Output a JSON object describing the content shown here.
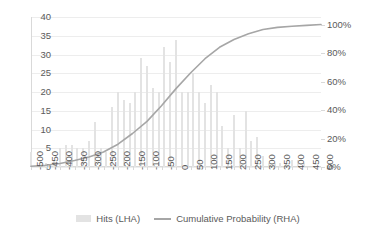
{
  "chart_data": {
    "type": "bar",
    "title": "",
    "subtitle": "",
    "xlabel": "",
    "ylabel": "",
    "y2label": "",
    "grid": true,
    "legend_position": "bottom",
    "xlim": [
      -500,
      500
    ],
    "ylim": [
      0,
      40
    ],
    "y2lim": [
      0,
      100
    ],
    "ytick_labels": [
      "40",
      "35",
      "30",
      "25",
      "20",
      "15",
      "10",
      "5",
      "0"
    ],
    "ytick_values": [
      40,
      35,
      30,
      25,
      20,
      15,
      10,
      5,
      0
    ],
    "y2tick_labels": [
      "100%",
      "80%",
      "60%",
      "40%",
      "20%",
      "0%"
    ],
    "y2tick_values": [
      100,
      80,
      60,
      40,
      20,
      0
    ],
    "xtick_labels": [
      "-500",
      "-450",
      "-400",
      "-350",
      "-300",
      "-250",
      "-200",
      "-150",
      "-100",
      "-50",
      "0",
      "50",
      "100",
      "150",
      "200",
      "250",
      "300",
      "350",
      "400",
      "450",
      "500"
    ],
    "xtick_values": [
      -500,
      -450,
      -400,
      -350,
      -300,
      -250,
      -200,
      -150,
      -100,
      -50,
      0,
      50,
      100,
      150,
      200,
      250,
      300,
      350,
      400,
      450,
      500
    ],
    "legend": [
      "Hits (LHA)",
      "Cumulative Probability (RHA)"
    ],
    "series": [
      {
        "name": "Hits (LHA)",
        "axis": "left",
        "type": "bar",
        "color": "#e3e3e3",
        "x": [
          -500,
          -490,
          -480,
          -470,
          -460,
          -450,
          -440,
          -430,
          -420,
          -410,
          -400,
          -390,
          -380,
          -370,
          -360,
          -350,
          -340,
          -330,
          -320,
          -310,
          -300,
          -290,
          -280,
          -270,
          -260,
          -250,
          -240,
          -230,
          -220,
          -210,
          -200,
          -190,
          -180,
          -170,
          -160,
          -150,
          -140,
          -130,
          -120,
          -110,
          -100,
          -90,
          -80,
          -70,
          -60,
          -50,
          -40,
          -30,
          -20,
          -10,
          0,
          10,
          20,
          30,
          40,
          50,
          60,
          70,
          80,
          90,
          100,
          110,
          120,
          130,
          140,
          150,
          160,
          170,
          180,
          190,
          200,
          210,
          220,
          230,
          240,
          250,
          260,
          270,
          280,
          290,
          300,
          310,
          320,
          330,
          340,
          350,
          360,
          370,
          380,
          390,
          400,
          410,
          420,
          430,
          440,
          450,
          460,
          470,
          480,
          490,
          500
        ],
        "values": [
          4,
          0,
          0,
          0,
          0,
          1,
          0,
          0,
          2,
          0,
          5,
          0,
          6,
          0,
          6,
          0,
          5,
          0,
          5,
          0,
          7,
          0,
          12,
          0,
          5,
          0,
          4,
          0,
          16,
          0,
          20,
          0,
          18,
          0,
          17,
          0,
          20,
          0,
          29,
          0,
          27,
          0,
          21,
          0,
          20,
          0,
          32,
          0,
          28,
          0,
          34,
          0,
          20,
          0,
          20,
          0,
          25,
          0,
          20,
          0,
          17,
          0,
          22,
          0,
          20,
          0,
          11,
          0,
          5,
          0,
          14,
          0,
          5,
          0,
          15,
          0,
          7,
          0,
          8,
          0,
          3,
          0,
          1,
          0,
          1,
          0,
          1,
          0,
          1,
          0,
          2,
          0,
          2,
          0,
          1,
          0,
          0,
          0,
          0,
          0,
          0
        ]
      },
      {
        "name": "Cumulative Probability (RHA)",
        "axis": "right",
        "type": "line",
        "color": "#a6a6a6",
        "x": [
          -500,
          -450,
          -400,
          -350,
          -300,
          -250,
          -200,
          -150,
          -100,
          -50,
          0,
          50,
          100,
          150,
          200,
          250,
          300,
          350,
          400,
          450,
          500
        ],
        "values": [
          0.5,
          1.2,
          2.5,
          4.5,
          7.0,
          10.5,
          16.0,
          23.5,
          32.0,
          43.0,
          55.0,
          66.0,
          76.0,
          84.0,
          89.5,
          93.5,
          96.5,
          98.0,
          98.8,
          99.4,
          100.0
        ]
      }
    ]
  },
  "legend_items": [
    {
      "label": "Hits (LHA)",
      "marker": "bar-swatch",
      "color": "#e3e3e3"
    },
    {
      "label": "Cumulative Probability (RHA)",
      "marker": "line-swatch",
      "color": "#a6a6a6"
    }
  ]
}
